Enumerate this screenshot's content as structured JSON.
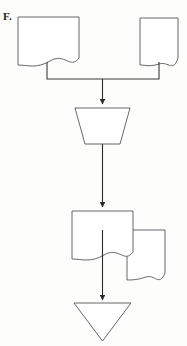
{
  "figure": {
    "label": "F.",
    "background_color": "#fdfdfc",
    "stroke_color": "#55565a",
    "fill_color": "#ffffff",
    "arrow_color": "#2b2b2b",
    "width": 187,
    "height": 346
  },
  "diagram": {
    "type": "flowchart",
    "orientation": "top-to-bottom",
    "nodes": [
      {
        "id": "doc-top-left",
        "shape": "document",
        "label": "",
        "x": 18,
        "y": 17,
        "width": 61,
        "height": 48
      },
      {
        "id": "doc-top-right",
        "shape": "document",
        "label": "",
        "x": 140,
        "y": 18,
        "width": 38,
        "height": 47
      },
      {
        "id": "manual-operation",
        "shape": "trapezoid",
        "label": "",
        "x": 75,
        "y": 108,
        "width": 55,
        "height": 36
      },
      {
        "id": "doc-lower-front",
        "shape": "document",
        "label": "",
        "x": 72,
        "y": 211,
        "width": 61,
        "height": 48
      },
      {
        "id": "doc-lower-back",
        "shape": "document",
        "label": "",
        "x": 127,
        "y": 230,
        "width": 38,
        "height": 50
      },
      {
        "id": "merge-triangle",
        "shape": "inverted-triangle",
        "label": "",
        "x": 74,
        "y": 303,
        "width": 57,
        "height": 38
      }
    ],
    "connectors": [
      {
        "id": "bus-from-top-documents",
        "from": [
          "doc-top-left",
          "doc-top-right"
        ],
        "to": "manual-operation",
        "style": "orthogonal-bus",
        "arrowhead": true
      },
      {
        "id": "manual-operation-to-documents",
        "from": "manual-operation",
        "to": "doc-lower-front",
        "style": "straight",
        "arrowhead": true
      },
      {
        "id": "documents-to-triangle",
        "from": "doc-lower-front",
        "to": "merge-triangle",
        "style": "straight",
        "arrowhead": true
      }
    ]
  }
}
